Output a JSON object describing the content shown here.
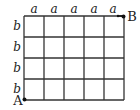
{
  "diagram": {
    "type": "grid",
    "columns": 5,
    "rows": 4,
    "column_labels": [
      "a",
      "a",
      "a",
      "a",
      "a"
    ],
    "row_labels": [
      "b",
      "b",
      "b",
      "b"
    ],
    "points": {
      "start": {
        "label": "A",
        "position": "bottom-left"
      },
      "end": {
        "label": "B",
        "position": "top-right"
      }
    },
    "line_color": "#333333"
  }
}
